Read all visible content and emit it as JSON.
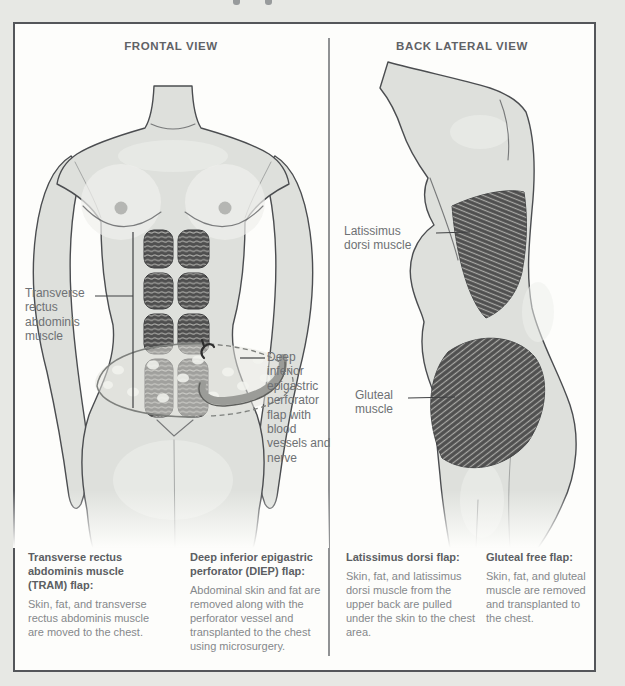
{
  "colors": {
    "page_bg": "#e7e8e4",
    "panel_bg": "#fdfdfb",
    "panel_border": "#54565a",
    "divider": "#909294",
    "header_text": "#5f6266",
    "label_text": "#6e7174",
    "caption_heading": "#5b5e62",
    "caption_body": "#85888b",
    "leader_line": "#3f4042",
    "body_fill": "#dee0dc",
    "body_line": "#4b4d50",
    "body_highlight": "#eff0ed",
    "muscle_dark": "#4f4f4f",
    "muscle_stripe": "#a9a9a6",
    "flap_fill": "#e3e4df",
    "flap_spot": "#f2f3ee",
    "flap_line": "#7e807d",
    "nipple": "#b5b6b3"
  },
  "panels": {
    "frontal": {
      "header": "FRONTAL VIEW",
      "labels": {
        "tram": "Transverse rectus abdominis muscle",
        "diep": "Deep inferior epigastric perforator flap with blood vessels and nerve"
      },
      "captions": [
        {
          "heading": "Transverse rectus abdominis muscle (TRAM) flap:",
          "body": "Skin, fat, and transverse rectus abdominis muscle are moved to the chest."
        },
        {
          "heading": "Deep inferior epigastric perforator (DIEP) flap:",
          "body": "Abdominal skin and fat are removed along with the perforator vessel and transplanted to the chest using microsurgery."
        }
      ]
    },
    "back": {
      "header": "BACK LATERAL VIEW",
      "labels": {
        "lat": "Latissimus dorsi muscle",
        "glute": "Gluteal muscle"
      },
      "captions": [
        {
          "heading": "Latissimus dorsi flap:",
          "body": "Skin, fat, and latissimus dorsi muscle from the upper back are pulled under the skin to the chest area."
        },
        {
          "heading": "Gluteal free flap:",
          "body": "Skin, fat, and gluteal muscle are removed and transplanted to the chest."
        }
      ]
    }
  }
}
